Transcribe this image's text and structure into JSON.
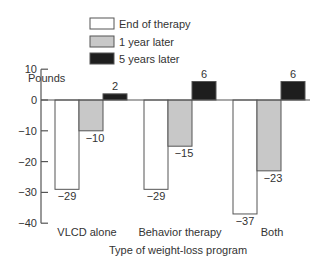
{
  "chart_data": {
    "type": "bar",
    "title": "",
    "xlabel": "Type of weight-loss program",
    "ylabel": "Pounds",
    "ylim": [
      -40,
      10
    ],
    "yticks": [
      10,
      0,
      -10,
      -20,
      -30,
      -40
    ],
    "ytick_labels": [
      "10",
      "0",
      "−10",
      "−20",
      "−30",
      "−40"
    ],
    "grid": false,
    "legend_position": "top",
    "categories": [
      "VLCD alone",
      "Behavior therapy",
      "Both"
    ],
    "series": [
      {
        "name": "End of therapy",
        "color": "#ffffff",
        "values": [
          -29,
          -29,
          -37
        ],
        "labels": [
          "−29",
          "−29",
          "−37"
        ]
      },
      {
        "name": "1 year later",
        "color": "#c8c8c8",
        "values": [
          -10,
          -15,
          -23
        ],
        "labels": [
          "−10",
          "−15",
          "−23"
        ]
      },
      {
        "name": "5 years later",
        "color": "#1e1e1e",
        "values": [
          2,
          6,
          6
        ],
        "labels": [
          "2",
          "6",
          "6"
        ]
      }
    ]
  },
  "colors": {
    "axis": "#555555",
    "outline": "#555555",
    "text": "#333333"
  }
}
